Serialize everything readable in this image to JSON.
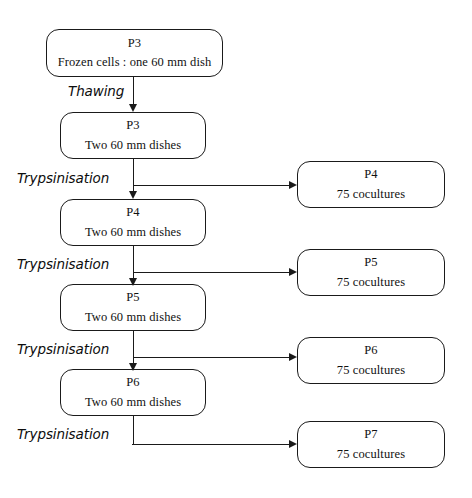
{
  "diagram": {
    "stroke_color": "#1a1a1a",
    "background_color": "#ffffff",
    "nodes": [
      {
        "id": "p3-frozen",
        "passage": "P3",
        "detail": "Frozen cells : one 60 mm dish",
        "column": "left",
        "x": 46,
        "y": 29,
        "w": 177,
        "h": 48
      },
      {
        "id": "p3-dishes",
        "passage": "P3",
        "detail": "Two 60 mm dishes",
        "column": "left",
        "x": 60,
        "y": 112,
        "w": 146,
        "h": 47
      },
      {
        "id": "p4-dishes",
        "passage": "P4",
        "detail": "Two 60 mm dishes",
        "column": "left",
        "x": 60,
        "y": 199,
        "w": 146,
        "h": 47
      },
      {
        "id": "p5-dishes",
        "passage": "P5",
        "detail": "Two 60 mm dishes",
        "column": "left",
        "x": 60,
        "y": 284,
        "w": 146,
        "h": 47
      },
      {
        "id": "p6-dishes",
        "passage": "P6",
        "detail": "Two 60 mm dishes",
        "column": "left",
        "x": 60,
        "y": 369,
        "w": 146,
        "h": 47
      },
      {
        "id": "p4-cocultures",
        "passage": "P4",
        "detail": "75 cocultures",
        "column": "right",
        "x": 297,
        "y": 161,
        "w": 148,
        "h": 47
      },
      {
        "id": "p5-cocultures",
        "passage": "P5",
        "detail": "75 cocultures",
        "column": "right",
        "x": 297,
        "y": 249,
        "w": 148,
        "h": 47
      },
      {
        "id": "p6-cocultures",
        "passage": "P6",
        "detail": "75 cocultures",
        "column": "right",
        "x": 297,
        "y": 337,
        "w": 148,
        "h": 47
      },
      {
        "id": "p7-cocultures",
        "passage": "P7",
        "detail": "75 cocultures",
        "column": "right",
        "x": 297,
        "y": 421,
        "w": 148,
        "h": 47
      }
    ],
    "step_labels": [
      {
        "id": "step-thawing",
        "text": "Thawing",
        "x": 68,
        "y": 83
      },
      {
        "id": "step-trypsinisation-1",
        "text": "Trypsinisation",
        "x": 17,
        "y": 170
      },
      {
        "id": "step-trypsinisation-2",
        "text": "Trypsinisation",
        "x": 17,
        "y": 255
      },
      {
        "id": "step-trypsinisation-3",
        "text": "Trypsinisation",
        "x": 17,
        "y": 340
      },
      {
        "id": "step-trypsinisation-4",
        "text": "Trypsinisation",
        "x": 17,
        "y": 425
      }
    ]
  }
}
